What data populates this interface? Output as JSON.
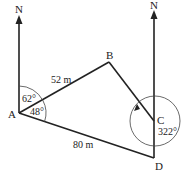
{
  "diagram": {
    "type": "bearings",
    "points": {
      "A": {
        "label": "A"
      },
      "B": {
        "label": "B"
      },
      "C": {
        "label": "C"
      },
      "D": {
        "label": "D"
      }
    },
    "north_labels": {
      "left": "N",
      "right": "N"
    },
    "distances": {
      "AB": "52 m",
      "AD": "80 m"
    },
    "angles": {
      "north_to_AB": "62°",
      "AB_to_AD": "48°",
      "bearing_at_C": "322°"
    },
    "colors": {
      "line": "#222222",
      "background": "#ffffff"
    }
  }
}
